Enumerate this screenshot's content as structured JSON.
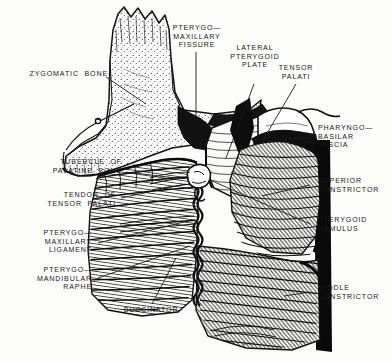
{
  "figure": {
    "signature": "K.J.L.",
    "ink_color": "#1a1a1a",
    "paper_color": "#fdfdfb"
  },
  "labels": [
    {
      "id": "zygomatic-bone",
      "text": "ZYGOMATIC  BONE",
      "align": "right"
    },
    {
      "id": "pterygo-maxillary-fissure",
      "text": "PTERYGO—\nMAXILLARY\nFISSURE",
      "align": "center"
    },
    {
      "id": "lateral-pterygoid-plate",
      "text": "LATERAL\nPTERYGOID\nPLATE",
      "align": "center"
    },
    {
      "id": "tensor-palati",
      "text": "TENSOR\nPALATI",
      "align": "center"
    },
    {
      "id": "pharyngo-basilar-fascia",
      "text": "PHARYNGO—\nBASILAR\nFASCIA",
      "align": "left"
    },
    {
      "id": "superior-constrictor",
      "text": "SUPERIOR\nCONSTRICTOR",
      "align": "left"
    },
    {
      "id": "pterygoid-hamulus",
      "text": "PTERYGOID\nHAMULUS",
      "align": "left"
    },
    {
      "id": "middle-constrictor",
      "text": "MIDDLE\nCONSTRICTOR",
      "align": "left"
    },
    {
      "id": "tubercle-of-palatine-bone",
      "text": "TUBERCLE  OF\nPALATINE  BONE",
      "align": "right"
    },
    {
      "id": "tendon-of-tensor-palati",
      "text": "TENDON  OF\nTENSOR  PALATI",
      "align": "right"
    },
    {
      "id": "pterygo-maxillary-ligament",
      "text": "PTERYGO—\nMAXILLARY\nLIGAMENT",
      "align": "right"
    },
    {
      "id": "pterygo-mandibular-raphe",
      "text": "PTERYGO—\nMANDIBULAR\nRAPHE",
      "align": "right"
    },
    {
      "id": "buccinator",
      "text": "BUCCINATOR",
      "align": "center"
    }
  ]
}
